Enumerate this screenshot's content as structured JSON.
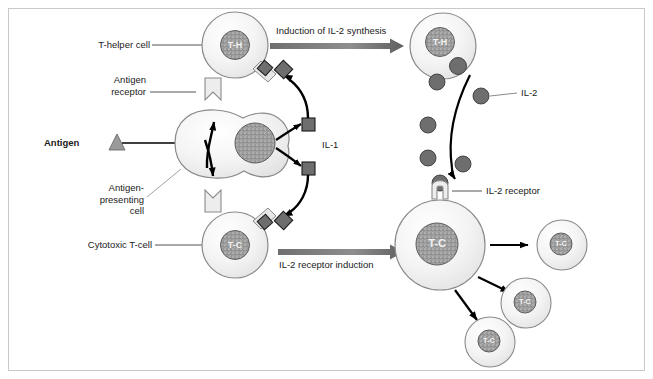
{
  "figure": {
    "width": 653,
    "height": 379,
    "background": "#ffffff",
    "border_color": "#c9c9c9"
  },
  "colors": {
    "cell_fill": "#f3f3f3",
    "cell_stroke": "#8a8a8a",
    "nucleus_fill": "#9a9a9a",
    "nucleus_stroke": "#5a5a5a",
    "cytokine_fill": "#6e6e6e",
    "cytokine_stroke": "#1a1a1a",
    "antigen_fill": "#9a9a9a",
    "arrow_black": "#000000",
    "block_arrow": "#7a7a7a",
    "leader_line": "#7a7a7a",
    "text": "#1a1a1a"
  },
  "labels": {
    "t_helper_cell": "T-helper cell",
    "antigen_receptor": "Antigen\nreceptor",
    "antigen": "Antigen",
    "antigen_presenting_cell": "Antigen-\npresenting\ncell",
    "cytotoxic_t_cell": "Cytotoxic T-cell",
    "il_1": "IL-1",
    "il_2": "IL-2",
    "il_2_receptor": "IL-2 receptor"
  },
  "process_arrows": [
    {
      "id": "induction-il2-synthesis",
      "label": "Induction of IL-2 synthesis",
      "label_position": "above"
    },
    {
      "id": "il2-receptor-induction",
      "label": "IL-2 receptor induction",
      "label_position": "below"
    }
  ],
  "cells": [
    {
      "id": "t-helper-resting",
      "marker": "T-H",
      "role": "resting T-helper cell"
    },
    {
      "id": "antigen-presenting-cell",
      "marker": "",
      "role": "antigen-presenting cell"
    },
    {
      "id": "cytotoxic-t-resting",
      "marker": "T-C",
      "role": "resting cytotoxic T-cell"
    },
    {
      "id": "t-helper-activated",
      "marker": "T-H",
      "role": "activated T-helper cell secreting IL-2"
    },
    {
      "id": "cytotoxic-t-activated",
      "marker": "T-C",
      "role": "activated cytotoxic T-cell with IL-2 receptor"
    },
    {
      "id": "cytotoxic-t-daughter-1",
      "marker": "T-C",
      "role": "daughter cytotoxic T-cell"
    },
    {
      "id": "cytotoxic-t-daughter-2",
      "marker": "T-C",
      "role": "daughter cytotoxic T-cell"
    },
    {
      "id": "cytotoxic-t-daughter-3",
      "marker": "T-C",
      "role": "daughter cytotoxic T-cell"
    }
  ]
}
